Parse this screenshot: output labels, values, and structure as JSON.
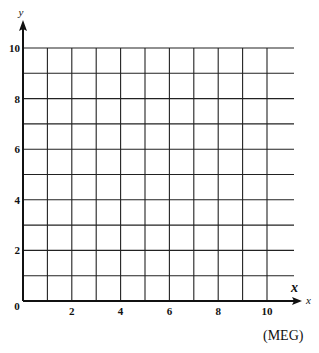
{
  "chart_data": {
    "type": "scatter",
    "title": "",
    "xlabel": "x",
    "ylabel": "y",
    "xlim": [
      0,
      10
    ],
    "ylim": [
      0,
      10
    ],
    "grid": true,
    "grid_step": 1,
    "x_ticks": [
      0,
      2,
      4,
      6,
      8,
      10
    ],
    "y_ticks": [
      0,
      2,
      4,
      6,
      8,
      10
    ],
    "x_tick_labels": [
      "0",
      "2",
      "4",
      "6",
      "8",
      "10"
    ],
    "y_tick_labels": [
      "2",
      "4",
      "6",
      "8",
      "10"
    ],
    "series": [],
    "annotations": [
      "x"
    ],
    "source": "(MEG)"
  },
  "labels": {
    "y_axis": "y",
    "x_axis": "x",
    "x_annotation": "x",
    "origin": "0",
    "source": "(MEG)"
  }
}
